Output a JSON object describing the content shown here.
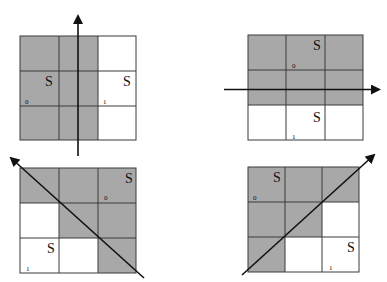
{
  "figure": {
    "colors": {
      "shaded": "#a8a8a8",
      "unshaded": "#ffffff",
      "grid_line": "#3a3a3a",
      "arrow": "#111111"
    },
    "panels": [
      {
        "id": "top-left",
        "arrow_direction": "up",
        "shaded_cells": [
          [
            0,
            0
          ],
          [
            0,
            1
          ],
          [
            1,
            0
          ],
          [
            1,
            1
          ],
          [
            2,
            0
          ],
          [
            2,
            1
          ]
        ],
        "labels": [
          {
            "text": "S",
            "row": 1,
            "col": 0,
            "pos": "upper-right"
          },
          {
            "text": "S",
            "row": 1,
            "col": 2,
            "pos": "upper-right"
          },
          {
            "text": "0",
            "row": 1,
            "col": 0,
            "pos": "lower-left"
          },
          {
            "text": "1",
            "row": 1,
            "col": 2,
            "pos": "lower-left"
          }
        ]
      },
      {
        "id": "top-right",
        "arrow_direction": "right",
        "shaded_cells": [
          [
            0,
            0
          ],
          [
            0,
            1
          ],
          [
            0,
            2
          ],
          [
            1,
            0
          ],
          [
            1,
            1
          ],
          [
            1,
            2
          ]
        ],
        "labels": [
          {
            "text": "S",
            "row": 0,
            "col": 1,
            "pos": "upper-right"
          },
          {
            "text": "0",
            "row": 0,
            "col": 1,
            "pos": "lower-left"
          },
          {
            "text": "S",
            "row": 2,
            "col": 1,
            "pos": "upper-right"
          },
          {
            "text": "1",
            "row": 2,
            "col": 1,
            "pos": "lower-left"
          }
        ]
      },
      {
        "id": "bottom-left",
        "arrow_direction": "up-left",
        "shaded_cells": [
          [
            0,
            0
          ],
          [
            0,
            1
          ],
          [
            0,
            2
          ],
          [
            1,
            1
          ],
          [
            1,
            2
          ],
          [
            2,
            2
          ]
        ],
        "labels": [
          {
            "text": "S",
            "row": 0,
            "col": 2,
            "pos": "upper-right"
          },
          {
            "text": "0",
            "row": 0,
            "col": 2,
            "pos": "lower-left"
          },
          {
            "text": "S",
            "row": 2,
            "col": 0,
            "pos": "upper-right"
          },
          {
            "text": "1",
            "row": 2,
            "col": 0,
            "pos": "lower-left"
          }
        ]
      },
      {
        "id": "bottom-right",
        "arrow_direction": "up-right",
        "shaded_cells": [
          [
            0,
            0
          ],
          [
            0,
            1
          ],
          [
            0,
            2
          ],
          [
            1,
            0
          ],
          [
            1,
            1
          ],
          [
            2,
            0
          ]
        ],
        "labels": [
          {
            "text": "S",
            "row": 0,
            "col": 0,
            "pos": "upper-right"
          },
          {
            "text": "0",
            "row": 0,
            "col": 0,
            "pos": "lower-left"
          },
          {
            "text": "S",
            "row": 2,
            "col": 2,
            "pos": "upper-right"
          },
          {
            "text": "1",
            "row": 2,
            "col": 2,
            "pos": "lower-left"
          }
        ]
      }
    ]
  },
  "labels": {
    "tl_s_left": "S",
    "tl_s_right": "S",
    "tl_zero": "0",
    "tl_one": "1",
    "tr_s_top": "S",
    "tr_zero": "0",
    "tr_s_bottom": "S",
    "tr_one": "1",
    "bl_s_top": "S",
    "bl_zero": "0",
    "bl_s_bottom": "S",
    "bl_one": "1",
    "br_s_top": "S",
    "br_zero": "0",
    "br_s_bottom": "S",
    "br_one": "1"
  }
}
